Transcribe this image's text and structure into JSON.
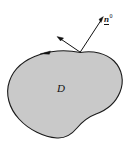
{
  "figure": {
    "type": "diagram",
    "canvas": {
      "width": 135,
      "height": 149,
      "background": "#ffffff"
    },
    "region": {
      "name": "D",
      "label": "D",
      "fill_color": "#c9c9c9",
      "stroke_color": "#1a1a1a",
      "stroke_width": 1.1,
      "label_position": {
        "x": 57,
        "y": 83
      }
    },
    "boundary": {
      "name": "boundary-curve",
      "orientation": "counterclockwise",
      "direction_arrow": {
        "label": "",
        "position": {
          "x": 45,
          "y": 53
        },
        "points_to": "left"
      }
    },
    "vectors": [
      {
        "id": "normal",
        "label_plain": "n0",
        "label_base": "n",
        "label_superscript": "0",
        "description": "outward unit normal vector",
        "underlined": true,
        "from": {
          "x": 80,
          "y": 52
        },
        "to": {
          "x": 103,
          "y": 17
        },
        "color": "#111111"
      },
      {
        "id": "tangent",
        "label_plain": "",
        "description": "tangent vector at boundary point",
        "underlined": false,
        "from": {
          "x": 80,
          "y": 52
        },
        "to": {
          "x": 57,
          "y": 37
        },
        "color": "#111111"
      }
    ]
  },
  "labels": {
    "region": "D",
    "normal_base": "n",
    "normal_superscript": "0"
  }
}
